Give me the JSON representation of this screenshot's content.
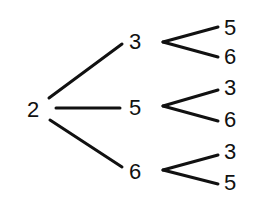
{
  "tree": {
    "root": {
      "label": "2",
      "x": 33,
      "y": 110
    },
    "level1": [
      {
        "label": "3",
        "x": 135,
        "y": 42,
        "children": [
          {
            "label": "5",
            "x": 230,
            "y": 28
          },
          {
            "label": "6",
            "x": 230,
            "y": 57
          }
        ]
      },
      {
        "label": "5",
        "x": 135,
        "y": 108,
        "children": [
          {
            "label": "3",
            "x": 230,
            "y": 88
          },
          {
            "label": "6",
            "x": 230,
            "y": 120
          }
        ]
      },
      {
        "label": "6",
        "x": 135,
        "y": 172,
        "children": [
          {
            "label": "3",
            "x": 230,
            "y": 152
          },
          {
            "label": "5",
            "x": 230,
            "y": 183
          }
        ]
      }
    ]
  },
  "colors": {
    "line": "#111111",
    "background": "#ffffff"
  }
}
